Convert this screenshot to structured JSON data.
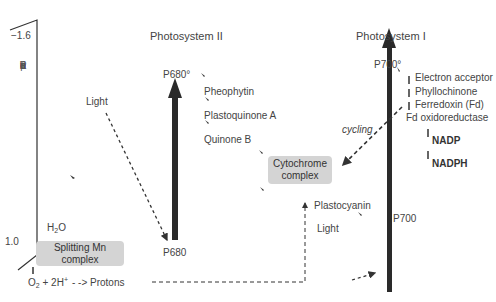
{
  "axis": {
    "top_label": "−1.6",
    "bottom_label": "1.0",
    "title_letters": [
      "R",
      "e",
      "d",
      "u",
      "c",
      "t",
      "i",
      "o",
      "n",
      "",
      "p",
      "o",
      "t."
    ]
  },
  "ps2": {
    "title": "Photosystem II",
    "excited": "P680°",
    "ground": "P680",
    "light": "Light",
    "chain": [
      "Pheophytin",
      "Plastoquinone A",
      "Quinone B"
    ]
  },
  "ps1": {
    "title": "Photosystem I",
    "excited": "P700°",
    "ground": "P700",
    "light": "Light",
    "chain": [
      "Electron acceptor",
      "Phyllochinone",
      "Ferredoxin (Fd)",
      "Fd oxidoreductase"
    ],
    "products": [
      "NADP",
      "NADPH"
    ],
    "cycling": "cycling"
  },
  "cytochrome": {
    "line1": "Cytochrome",
    "line2": "complex"
  },
  "plastocyanin": "Plastocyanin",
  "water": {
    "h2o_main": "H",
    "h2o_sub": "2",
    "h2o_end": "O"
  },
  "mn_complex": "Splitting Mn complex",
  "products_bottom": {
    "o": "O",
    "o_sub": "2",
    "plus": " + 2H",
    "h_sup": "+",
    "protons": "Protons"
  },
  "colors": {
    "arrow": "#2a2a2a",
    "box": "#d4d4d4",
    "text": "#444444"
  }
}
